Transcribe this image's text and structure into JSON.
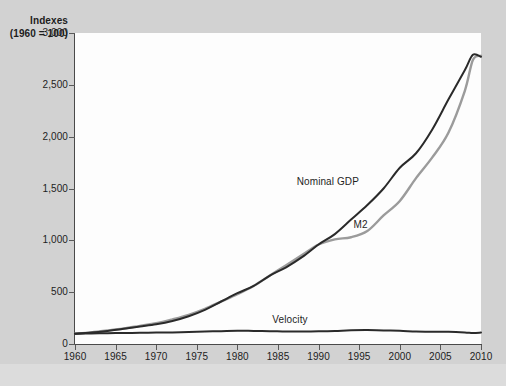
{
  "chart_data": {
    "type": "line",
    "title": "",
    "axis_title": "Indexes",
    "axis_subtitle": "(1960 = 100)",
    "xlabel": "",
    "ylabel": "Indexes (1960 = 100)",
    "xlim": [
      1960,
      2010
    ],
    "ylim": [
      0,
      3000
    ],
    "grid": false,
    "legend_position": "inline-annotations",
    "ytick_labels": [
      "0",
      "500",
      "1,000",
      "1,500",
      "2,000",
      "2,500",
      "3,000"
    ],
    "ytick_values": [
      0,
      500,
      1000,
      1500,
      2000,
      2500,
      3000
    ],
    "xtick_labels": [
      "1960",
      "1965",
      "1970",
      "1975",
      "1980",
      "1985",
      "1990",
      "1995",
      "2000",
      "2005",
      "2010"
    ],
    "xtick_values": [
      1960,
      1965,
      1970,
      1975,
      1980,
      1985,
      1990,
      1995,
      2000,
      2005,
      2010
    ],
    "x": [
      1960,
      1962,
      1964,
      1966,
      1968,
      1970,
      1972,
      1974,
      1976,
      1978,
      1980,
      1982,
      1984,
      1986,
      1988,
      1990,
      1992,
      1994,
      1996,
      1998,
      2000,
      2002,
      2004,
      2006,
      2008,
      2009,
      2010
    ],
    "series": [
      {
        "name": "Nominal GDP",
        "color": "#2a2a2a",
        "label_x": 1991,
        "label_y": 1560,
        "values": [
          100,
          110,
          126,
          146,
          168,
          190,
          222,
          268,
          330,
          410,
          490,
          560,
          660,
          740,
          840,
          960,
          1060,
          1200,
          1340,
          1500,
          1700,
          1840,
          2070,
          2360,
          2640,
          2790,
          2770
        ]
      },
      {
        "name": "M2",
        "color": "#9b9b9b",
        "label_x": 1998,
        "label_y": 1150,
        "values": [
          100,
          112,
          130,
          150,
          175,
          200,
          238,
          282,
          340,
          410,
          480,
          560,
          660,
          760,
          860,
          960,
          1010,
          1030,
          1090,
          1240,
          1380,
          1600,
          1800,
          2040,
          2440,
          2740,
          2780
        ]
      },
      {
        "name": "Velocity",
        "color": "#2a2a2a",
        "label_x": 1988,
        "label_y": 230,
        "values": [
          100,
          102,
          104,
          106,
          108,
          110,
          112,
          116,
          120,
          124,
          128,
          126,
          124,
          120,
          120,
          122,
          126,
          132,
          134,
          130,
          128,
          120,
          118,
          118,
          112,
          106,
          110
        ]
      }
    ]
  }
}
